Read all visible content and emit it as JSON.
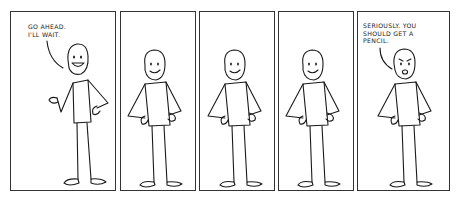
{
  "comic": {
    "panel_count": 5,
    "panels": [
      {
        "index": 1,
        "caption": "GO AHEAD.\nI'LL WAIT.",
        "expression": "grin",
        "pose": "one-hand-raised"
      },
      {
        "index": 2,
        "caption": "",
        "expression": "smile",
        "pose": "hands-on-hips"
      },
      {
        "index": 3,
        "caption": "",
        "expression": "smile",
        "pose": "hands-on-hips"
      },
      {
        "index": 4,
        "caption": "",
        "expression": "smile",
        "pose": "hands-on-hips"
      },
      {
        "index": 5,
        "caption": "SERIOUSLY. YOU\nSHOULD GET A\nPENCIL.",
        "expression": "worried",
        "pose": "hands-on-hips"
      }
    ]
  },
  "colors": {
    "ink": "#1a1a1a",
    "border": "#333333",
    "background": "#ffffff"
  }
}
